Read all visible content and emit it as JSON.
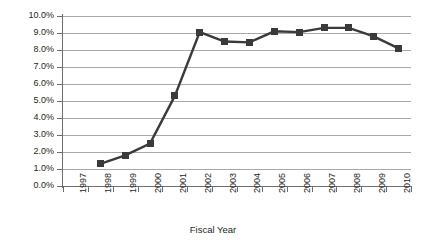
{
  "chart_data": {
    "type": "line",
    "title": "",
    "xlabel": "Fiscal Year",
    "ylabel": "",
    "categories": [
      "1997",
      "1998",
      "1999",
      "2000",
      "2001",
      "2002",
      "2003",
      "2004",
      "2005",
      "2006",
      "2007",
      "2008",
      "2009",
      "2010"
    ],
    "series": [
      {
        "name": "Series 1",
        "values": [
          null,
          1.3,
          1.8,
          2.5,
          5.3,
          9.05,
          8.5,
          8.45,
          9.1,
          9.05,
          9.3,
          9.3,
          8.8,
          8.1
        ]
      }
    ],
    "ylim": [
      0,
      10
    ],
    "ytick_labels": [
      "0.0%",
      "1.0%",
      "2.0%",
      "3.0%",
      "4.0%",
      "5.0%",
      "6.0%",
      "7.0%",
      "8.0%",
      "9.0%",
      "10.0%"
    ],
    "ytick_values": [
      0,
      1,
      2,
      3,
      4,
      5,
      6,
      7,
      8,
      9,
      10
    ],
    "grid": true,
    "legend": "none",
    "marker": "square",
    "series_color": "#3a3a3a",
    "gridline_color": "#a9a9a9",
    "axis_color": "#6e6e6e",
    "background_color": "#ffffff"
  }
}
